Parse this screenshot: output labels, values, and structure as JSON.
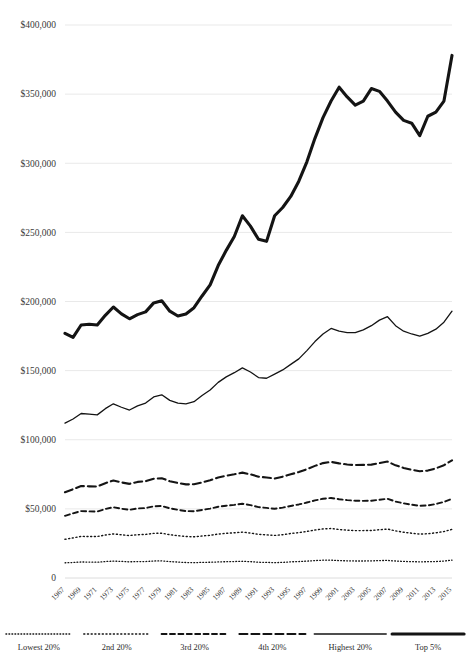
{
  "chart_data": {
    "type": "line",
    "title": "",
    "subtitle": "",
    "xlabel": "",
    "ylabel": "",
    "ylim": [
      0,
      400000
    ],
    "xlim": [
      1967,
      2015
    ],
    "grid": true,
    "legend_position": "bottom",
    "y_ticks": [
      0,
      50000,
      100000,
      150000,
      200000,
      250000,
      300000,
      350000,
      400000
    ],
    "y_tick_labels": [
      "0",
      "$50,000",
      "$100,000",
      "$150,000",
      "$200,000",
      "$250,000",
      "$300,000",
      "$350,000",
      "$400,000"
    ],
    "x": [
      1967,
      1968,
      1969,
      1970,
      1971,
      1972,
      1973,
      1974,
      1975,
      1976,
      1977,
      1978,
      1979,
      1980,
      1981,
      1982,
      1983,
      1984,
      1985,
      1986,
      1987,
      1988,
      1989,
      1990,
      1991,
      1992,
      1993,
      1994,
      1995,
      1996,
      1997,
      1998,
      1999,
      2000,
      2001,
      2002,
      2003,
      2004,
      2005,
      2006,
      2007,
      2008,
      2009,
      2010,
      2011,
      2012,
      2013,
      2014,
      2015
    ],
    "x_tick_labels": [
      "1967",
      "1969",
      "1971",
      "1973",
      "1975",
      "1977",
      "1979",
      "1981",
      "1983",
      "1985",
      "1987",
      "1989",
      "1991",
      "1993",
      "1995",
      "1997",
      "1999",
      "2001",
      "2003",
      "2005",
      "2007",
      "2009",
      "2011",
      "2013",
      "2015"
    ],
    "series": [
      {
        "name": "Lowest 20%",
        "style": "fine-dotted",
        "values": [
          11000,
          11200,
          11600,
          11500,
          11400,
          11900,
          12200,
          12000,
          11700,
          11900,
          11900,
          12300,
          12400,
          11900,
          11500,
          11200,
          11100,
          11300,
          11400,
          11600,
          11800,
          11900,
          12100,
          11800,
          11400,
          11300,
          11100,
          11300,
          11700,
          11900,
          12200,
          12600,
          12900,
          12900,
          12600,
          12400,
          12300,
          12300,
          12400,
          12600,
          12700,
          12300,
          12000,
          11800,
          11700,
          11800,
          11900,
          12300,
          12900
        ]
      },
      {
        "name": "2nd 20%",
        "style": "dotted",
        "values": [
          28000,
          29000,
          30100,
          30000,
          30000,
          31100,
          31900,
          31300,
          30700,
          31300,
          31500,
          32300,
          32400,
          31300,
          30600,
          30000,
          29800,
          30400,
          30900,
          31800,
          32300,
          32700,
          33200,
          32500,
          31600,
          31200,
          30800,
          31300,
          32200,
          32800,
          33700,
          34700,
          35500,
          35800,
          35100,
          34600,
          34300,
          34300,
          34400,
          34900,
          35400,
          34100,
          33100,
          32400,
          31800,
          32000,
          32700,
          33600,
          35200
        ]
      },
      {
        "name": "3rd 20%",
        "style": "dashed-short",
        "values": [
          45000,
          46800,
          48400,
          48200,
          48100,
          49900,
          51200,
          50100,
          49300,
          50300,
          50600,
          51800,
          52100,
          50400,
          49300,
          48400,
          48300,
          49200,
          50200,
          51500,
          52300,
          52900,
          53700,
          52700,
          51300,
          50700,
          50100,
          50900,
          52100,
          53200,
          54600,
          56100,
          57300,
          57900,
          57000,
          56300,
          55900,
          55800,
          55900,
          56600,
          57300,
          55300,
          54000,
          53000,
          52200,
          52500,
          53500,
          55000,
          57300
        ]
      },
      {
        "name": "4th 20%",
        "style": "dashed-long",
        "values": [
          62000,
          64200,
          66500,
          66300,
          66200,
          68600,
          70500,
          69100,
          68100,
          69500,
          70000,
          71800,
          72200,
          70000,
          68700,
          67700,
          67800,
          69100,
          70700,
          72700,
          74000,
          75000,
          76200,
          75000,
          73300,
          72700,
          72000,
          73300,
          75000,
          76600,
          78700,
          81100,
          83100,
          84000,
          82900,
          82100,
          81700,
          81800,
          82000,
          83100,
          84200,
          81500,
          79600,
          78300,
          77200,
          77700,
          79300,
          81600,
          85100
        ]
      },
      {
        "name": "Highest 20%",
        "style": "solid-thin",
        "values": [
          112000,
          115000,
          119000,
          118500,
          118000,
          122500,
          126000,
          123500,
          121500,
          124500,
          126500,
          131000,
          132500,
          128500,
          126500,
          126000,
          127500,
          132000,
          136000,
          141500,
          145500,
          148500,
          152000,
          149000,
          145000,
          144500,
          147500,
          150500,
          154500,
          158500,
          164500,
          171000,
          176500,
          180500,
          178500,
          177500,
          177500,
          179500,
          182500,
          186500,
          189000,
          182500,
          178500,
          176500,
          175000,
          177000,
          180000,
          185000,
          193000
        ]
      },
      {
        "name": "Top 5%",
        "style": "solid-thick",
        "values": [
          177000,
          174000,
          183000,
          183500,
          183000,
          190000,
          196000,
          191000,
          187500,
          190500,
          192500,
          199000,
          200500,
          193000,
          189500,
          191000,
          195500,
          204000,
          212000,
          226000,
          237000,
          247000,
          262000,
          254500,
          245000,
          243500,
          262000,
          268000,
          276000,
          287000,
          301000,
          318000,
          333000,
          345000,
          355000,
          348000,
          342000,
          345000,
          354000,
          352000,
          345000,
          337000,
          331000,
          329000,
          320000,
          334000,
          337000,
          345000,
          378000
        ]
      }
    ]
  },
  "legend": {
    "items": [
      {
        "label": "Lowest 20%",
        "style": "fine-dotted"
      },
      {
        "label": "2nd 20%",
        "style": "dotted"
      },
      {
        "label": "3rd 20%",
        "style": "dashed-short"
      },
      {
        "label": "4th 20%",
        "style": "dashed-long"
      },
      {
        "label": "Highest 20%",
        "style": "solid-thin"
      },
      {
        "label": "Top 5%",
        "style": "solid-thick"
      }
    ]
  },
  "colors": {
    "line": "#141414",
    "grid": "#e9e9e9",
    "text": "#2b2b2b",
    "background": "#ffffff"
  }
}
